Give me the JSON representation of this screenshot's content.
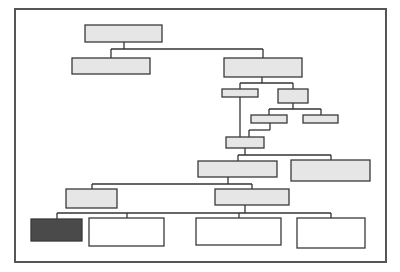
{
  "diagram": {
    "type": "hierarchy-tree",
    "colors": {
      "frame": "#555555",
      "line": "#333333",
      "box_fill_light": "#e6e6e6",
      "box_fill_white": "#ffffff",
      "box_fill_dark": "#4a4a4a",
      "box_stroke": "#3a3a3a"
    },
    "frame": {
      "x": 15,
      "y": 9,
      "w": 371,
      "h": 253
    },
    "nodes": [
      {
        "id": "A",
        "x": 85,
        "y": 25,
        "w": 77,
        "h": 17,
        "fill": "light"
      },
      {
        "id": "B",
        "x": 72,
        "y": 58,
        "w": 78,
        "h": 16,
        "fill": "light"
      },
      {
        "id": "C",
        "x": 224,
        "y": 58,
        "w": 78,
        "h": 19,
        "fill": "light"
      },
      {
        "id": "D",
        "x": 222,
        "y": 89,
        "w": 36,
        "h": 8,
        "fill": "light"
      },
      {
        "id": "E",
        "x": 278,
        "y": 89,
        "w": 30,
        "h": 14,
        "fill": "light"
      },
      {
        "id": "F",
        "x": 251,
        "y": 115,
        "w": 36,
        "h": 8,
        "fill": "light"
      },
      {
        "id": "G",
        "x": 303,
        "y": 115,
        "w": 35,
        "h": 8,
        "fill": "light"
      },
      {
        "id": "H",
        "x": 226,
        "y": 137,
        "w": 38,
        "h": 11,
        "fill": "light"
      },
      {
        "id": "I",
        "x": 198,
        "y": 161,
        "w": 79,
        "h": 16,
        "fill": "light"
      },
      {
        "id": "J",
        "x": 291,
        "y": 160,
        "w": 79,
        "h": 21,
        "fill": "light"
      },
      {
        "id": "K",
        "x": 215,
        "y": 189,
        "w": 74,
        "h": 16,
        "fill": "light"
      },
      {
        "id": "L",
        "x": 66,
        "y": 189,
        "w": 51,
        "h": 19,
        "fill": "light"
      },
      {
        "id": "M",
        "x": 31,
        "y": 219,
        "w": 51,
        "h": 22,
        "fill": "dark"
      },
      {
        "id": "N",
        "x": 89,
        "y": 218,
        "w": 75,
        "h": 28,
        "fill": "white"
      },
      {
        "id": "O",
        "x": 196,
        "y": 218,
        "w": 85,
        "h": 27,
        "fill": "white"
      },
      {
        "id": "P",
        "x": 297,
        "y": 218,
        "w": 68,
        "h": 30,
        "fill": "white"
      }
    ],
    "connectors": [
      {
        "from": "A",
        "to": [
          "B",
          "C"
        ],
        "bus_y": 49,
        "drop_x": 124
      },
      {
        "from": "C",
        "to": [
          "D",
          "E"
        ],
        "bus_y": 83,
        "drop_x": 262
      },
      {
        "from": "E",
        "to": [
          "F",
          "G"
        ],
        "bus_y": 109,
        "drop_x": 293
      },
      {
        "from": "F",
        "to": [
          "H"
        ],
        "path": [
          [
            270,
            123
          ],
          [
            270,
            130
          ],
          [
            249,
            130
          ],
          [
            249,
            137
          ]
        ]
      },
      {
        "from": "D",
        "to": [
          "H"
        ],
        "path": [
          [
            240,
            97
          ],
          [
            240,
            137
          ]
        ]
      },
      {
        "from": "H",
        "to": [
          "I",
          "J"
        ],
        "bus_y": 155,
        "drop_x": 245
      },
      {
        "from": "I",
        "to": [
          "L",
          "K"
        ],
        "bus_y": 184,
        "drop_x": 228
      },
      {
        "from": "K",
        "to": [
          "M",
          "N",
          "O",
          "P"
        ],
        "bus_y": 213,
        "drop_x": 245
      }
    ]
  }
}
